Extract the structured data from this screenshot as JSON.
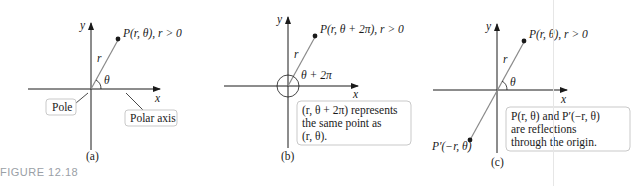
{
  "figure_caption": "FIGURE 12.18",
  "colors": {
    "line": "#1a1a1a",
    "radius": "#8a8a8a",
    "callout_border": "#c9c9c9",
    "caption": "#9aa0a6"
  },
  "panels": [
    {
      "id": "a",
      "sublabel": "(a)",
      "axis_x": "x",
      "axis_y": "y",
      "point_label": "P(r, θ), r > 0",
      "radius_label": "r",
      "angle_label": "θ",
      "callouts": [
        "Pole",
        "Polar axis"
      ]
    },
    {
      "id": "b",
      "sublabel": "(b)",
      "axis_x": "x",
      "axis_y": "y",
      "point_label": "P(r, θ + 2π), r > 0",
      "radius_label": "r",
      "angle_label": "θ + 2π",
      "callout_lines": [
        "(r, θ + 2π) represents",
        "the same point as",
        "(r, θ)."
      ]
    },
    {
      "id": "c",
      "sublabel": "(c)",
      "axis_x": "x",
      "axis_y": "y",
      "point_label": "P(r, θ), r > 0",
      "reflected_point_label": "P′(−r, θ)",
      "radius_label": "r",
      "angle_label": "θ",
      "callout_lines": [
        "P(r, θ) and P′(−r, θ)",
        "are reflections",
        "through the origin."
      ]
    }
  ]
}
